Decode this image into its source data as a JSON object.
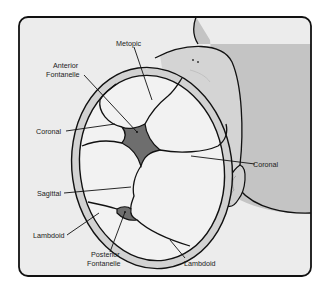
{
  "diagram": {
    "labels": {
      "metopic": "Metopic",
      "anterior_fontanelle_1": "Anterior",
      "anterior_fontanelle_2": "Fontanelle",
      "coronal_left": "Coronal",
      "coronal_right": "Coronal",
      "sagittal": "Sagittal",
      "lambdoid_left": "Lambdoid",
      "lambdoid_right": "Lambdoid",
      "posterior_fontanelle_1": "Posterior",
      "posterior_fontanelle_2": "Fontanelle"
    },
    "colors": {
      "background_panel": "#ececec",
      "body_shadow": "#c4c4c4",
      "skull_rim": "#d2d2d2",
      "bone_plate": "#f4f4f4",
      "fontanelle": "#6e6e6e",
      "outline": "#111111"
    }
  }
}
